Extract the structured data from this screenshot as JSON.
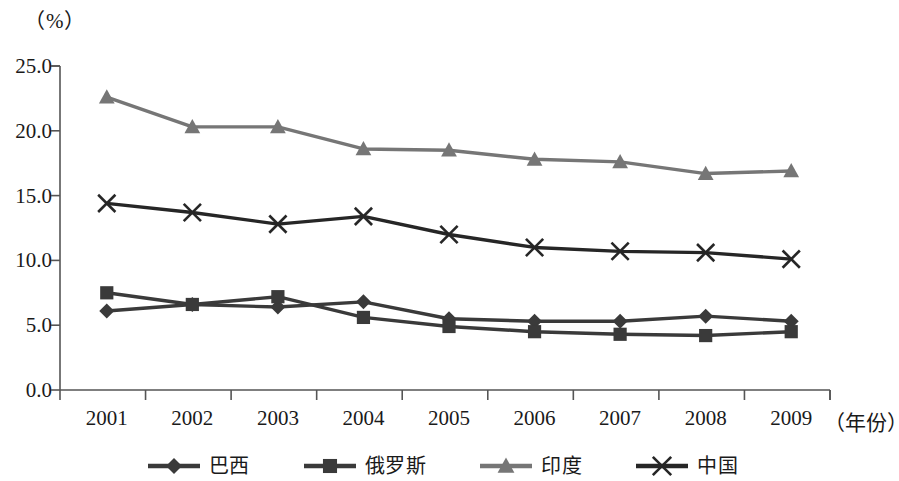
{
  "chart_data": {
    "type": "line",
    "title": "",
    "unit_label": "（%）",
    "xlabel": "（年份）",
    "ylabel": "",
    "categories": [
      "2001",
      "2002",
      "2003",
      "2004",
      "2005",
      "2006",
      "2007",
      "2008",
      "2009"
    ],
    "ylim": [
      0.0,
      25.0
    ],
    "ytick_labels": [
      "0.0",
      "5.0",
      "10.0",
      "15.0",
      "20.0",
      "25.0"
    ],
    "ytick_values": [
      0.0,
      5.0,
      10.0,
      15.0,
      20.0,
      25.0
    ],
    "grid": false,
    "legend_position": "bottom",
    "series": [
      {
        "name": "巴西",
        "marker": "diamond",
        "color": "#3a3a3a",
        "values": [
          6.1,
          6.6,
          6.4,
          6.8,
          5.5,
          5.3,
          5.3,
          5.7,
          5.3
        ]
      },
      {
        "name": "俄罗斯",
        "marker": "square",
        "color": "#3a3a3a",
        "values": [
          7.5,
          6.6,
          7.2,
          5.6,
          4.9,
          4.5,
          4.3,
          4.2,
          4.5
        ]
      },
      {
        "name": "印度",
        "marker": "triangle",
        "color": "#767676",
        "values": [
          22.6,
          20.3,
          20.3,
          18.6,
          18.5,
          17.8,
          17.6,
          16.7,
          16.9
        ]
      },
      {
        "name": "中国",
        "marker": "cross",
        "color": "#262626",
        "values": [
          14.4,
          13.7,
          12.8,
          13.4,
          12.0,
          11.0,
          10.7,
          10.6,
          10.1
        ]
      }
    ]
  },
  "legend": {
    "items": [
      {
        "label": "巴西",
        "marker": "diamond",
        "color": "#3a3a3a"
      },
      {
        "label": "俄罗斯",
        "marker": "square",
        "color": "#3a3a3a"
      },
      {
        "label": "印度",
        "marker": "triangle",
        "color": "#767676"
      },
      {
        "label": "中国",
        "marker": "cross",
        "color": "#262626"
      }
    ]
  },
  "axis": {
    "unit_label": "（%）",
    "x_axis_name": "（年份）"
  }
}
